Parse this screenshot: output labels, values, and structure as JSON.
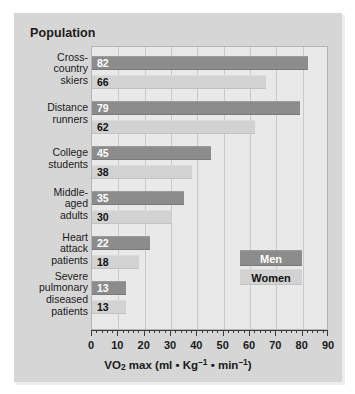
{
  "panel": {
    "title": "Population"
  },
  "legend": {
    "men_label": "Men",
    "women_label": "Women",
    "men_color": "#8c8c8c",
    "women_color": "#d2d2d2"
  },
  "axis": {
    "title_main": "VO",
    "title_sub": "2",
    "title_rest": " max (ml • Kg",
    "title_sup1": "–1",
    "title_mid": " • min",
    "title_sup2": "–1",
    "title_close": ")",
    "ticks": [
      "0",
      "10",
      "20",
      "30",
      "40",
      "50",
      "60",
      "70",
      "80",
      "90"
    ]
  },
  "chart_data": {
    "type": "bar",
    "orientation": "horizontal",
    "title": "Population",
    "xlabel": "VO2 max (ml • Kg–1 • min–1)",
    "ylabel": "Population",
    "xlim": [
      0,
      90
    ],
    "xtick_step": 10,
    "xminor_step": 2,
    "grid": true,
    "legend_position": "inside-right",
    "categories": [
      "Cross-country skiers",
      "Distance runners",
      "College students",
      "Middle-aged adults",
      "Heart attack patients",
      "Severe pulmonary diseased patients"
    ],
    "category_lines": [
      [
        "Cross-",
        "country",
        "skiers"
      ],
      [
        "Distance",
        "runners"
      ],
      [
        "College",
        "students"
      ],
      [
        "Middle-",
        "aged",
        "adults"
      ],
      [
        "Heart",
        "attack",
        "patients"
      ],
      [
        "Severe",
        "pulmonary",
        "diseased",
        "patients"
      ]
    ],
    "series": [
      {
        "name": "Men",
        "color": "#8c8c8c",
        "values": [
          82,
          79,
          45,
          35,
          22,
          13
        ]
      },
      {
        "name": "Women",
        "color": "#d2d2d2",
        "values": [
          66,
          62,
          38,
          30,
          18,
          13
        ]
      }
    ]
  }
}
